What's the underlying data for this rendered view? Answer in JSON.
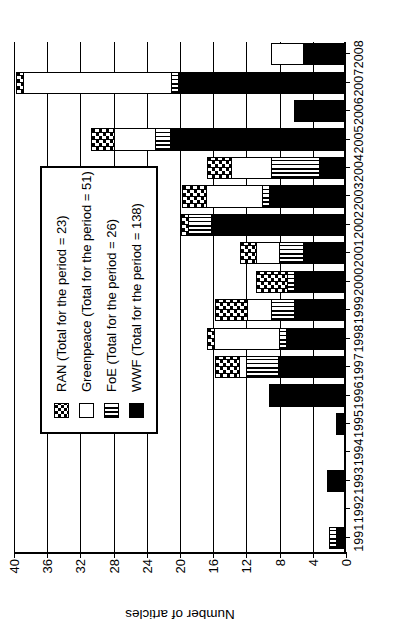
{
  "chart_data": {
    "type": "bar",
    "title": "",
    "xlabel": "",
    "ylabel": "Number of articles",
    "ylim": [
      0,
      40
    ],
    "ytick_values": [
      0,
      4,
      8,
      12,
      16,
      20,
      24,
      28,
      32,
      36,
      40
    ],
    "grid": true,
    "stacked": true,
    "orientation": "vertical",
    "legend_position": "upper-left-inset",
    "categories": [
      "1991",
      "1992",
      "1993",
      "1994",
      "1995",
      "1996",
      "1997",
      "1998",
      "1999",
      "2000",
      "2001",
      "2002",
      "2003",
      "2004",
      "2005",
      "2006",
      "2007",
      "2008"
    ],
    "series": [
      {
        "name": "WWF",
        "legend": "WWF (Total for the period = 138)",
        "total": 138,
        "pattern": "solid-black",
        "values": [
          1,
          0,
          2,
          0,
          1,
          9,
          8,
          7,
          6,
          6,
          5,
          16,
          9,
          3,
          21,
          6,
          20,
          5
        ]
      },
      {
        "name": "FoE",
        "legend": "FoE (Total for the period = 26)",
        "total": 26,
        "pattern": "vertical-stripes",
        "values": [
          1,
          0,
          0,
          0,
          0,
          0,
          4,
          1,
          3,
          1,
          3,
          3,
          1,
          6,
          2,
          0,
          1,
          0
        ]
      },
      {
        "name": "Greenpeace",
        "legend": "Greenpeace (Total for the period = 51)",
        "total": 51,
        "pattern": "white",
        "values": [
          0,
          0,
          0,
          0,
          0,
          0,
          1,
          8,
          3,
          0,
          3,
          0,
          7,
          5,
          5,
          0,
          18,
          4
        ]
      },
      {
        "name": "RAN",
        "legend": "RAN (Total for the period = 23)",
        "total": 23,
        "pattern": "checkerboard",
        "values": [
          0,
          0,
          0,
          0,
          0,
          0,
          3,
          1,
          4,
          4,
          2,
          1,
          3,
          3,
          3,
          0,
          1,
          0
        ]
      }
    ]
  },
  "legend": {
    "items": [
      {
        "label": "RAN (Total for the period = 23)",
        "key": "ran"
      },
      {
        "label": "Greenpeace (Total for the period = 51)",
        "key": "greenpeace"
      },
      {
        "label": "FoE (Total for the period = 26)",
        "key": "foe"
      },
      {
        "label": "WWF (Total for the period = 138)",
        "key": "wwf"
      }
    ]
  },
  "axis": {
    "y_title": "Number of articles"
  }
}
